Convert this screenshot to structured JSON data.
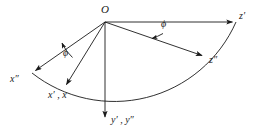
{
  "figure": {
    "type": "vector-diagram",
    "background_color": "#ffffff",
    "stroke_color": "#1a1a1a",
    "text_color": "#1a1a1a"
  },
  "origin": {
    "label": "O",
    "x": 105,
    "y": 22
  },
  "axes": [
    {
      "name": "x-double-prime",
      "label": "x″",
      "tip": {
        "x": 32,
        "y": 73
      },
      "label_pos": {
        "x": 12,
        "y": 78
      }
    },
    {
      "name": "x-prime-and-x",
      "label": "x′ , x",
      "tip": {
        "x": 68,
        "y": 88
      },
      "label_pos": {
        "x": 50,
        "y": 92
      }
    },
    {
      "name": "y-prime-and-y-double-prime",
      "label": "y′ , y″",
      "tip": {
        "x": 105,
        "y": 121
      },
      "label_pos": {
        "x": 110,
        "y": 116
      }
    },
    {
      "name": "z-double-prime",
      "label": "z″",
      "tip": {
        "x": 205,
        "y": 58
      },
      "label_pos": {
        "x": 209,
        "y": 57
      }
    },
    {
      "name": "z-prime",
      "label": "z′",
      "tip": {
        "x": 236,
        "y": 22
      },
      "label_pos": {
        "x": 239,
        "y": 13
      }
    }
  ],
  "angles": [
    {
      "name": "phi-left",
      "label": "ϕ",
      "label_pos": {
        "x": 66,
        "y": 50
      },
      "between": [
        "x-double-prime",
        "x-prime-and-x"
      ]
    },
    {
      "name": "phi-right",
      "label": "ϕ",
      "label_pos": {
        "x": 163,
        "y": 22
      },
      "between": [
        "z-double-prime",
        "z-prime"
      ]
    }
  ],
  "arc": {
    "name": "sweep-arc",
    "start": {
      "x": 32,
      "y": 73
    },
    "end": {
      "x": 236,
      "y": 22
    },
    "radius": 133
  }
}
